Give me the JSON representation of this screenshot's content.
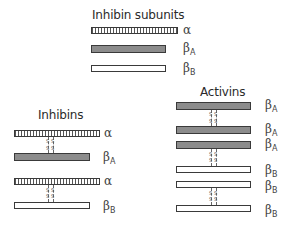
{
  "diagram": {
    "subunits": {
      "title": "Inhibin subunits",
      "items": [
        {
          "name": "alpha",
          "symbol": "α",
          "sub": "",
          "style": "hatched"
        },
        {
          "name": "betaA",
          "symbol": "β",
          "sub": "A",
          "style": "gray"
        },
        {
          "name": "betaB",
          "symbol": "β",
          "sub": "B",
          "style": "white"
        }
      ]
    },
    "inhibins": {
      "title": "Inhibins",
      "dimers": [
        {
          "top": {
            "symbol": "α",
            "sub": ""
          },
          "bottom": {
            "symbol": "β",
            "sub": "A"
          }
        },
        {
          "top": {
            "symbol": "α",
            "sub": ""
          },
          "bottom": {
            "symbol": "β",
            "sub": "B"
          }
        }
      ]
    },
    "activins": {
      "title": "Activins",
      "dimers": [
        {
          "top": {
            "symbol": "β",
            "sub": "A"
          },
          "bottom": {
            "symbol": "β",
            "sub": "A"
          }
        },
        {
          "top": {
            "symbol": "β",
            "sub": "A"
          },
          "bottom": {
            "symbol": "β",
            "sub": "B"
          }
        },
        {
          "top": {
            "symbol": "β",
            "sub": "B"
          },
          "bottom": {
            "symbol": "β",
            "sub": "B"
          }
        }
      ]
    },
    "bond_label": "S S",
    "colors": {
      "gray_fill": "#8c8c8c",
      "outline": "#3a3a3a",
      "text": "#333333"
    }
  }
}
